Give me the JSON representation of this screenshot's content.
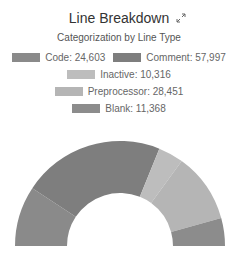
{
  "header": {
    "title": "Line Breakdown",
    "subtitle": "Categorization by Line Type",
    "expand_icon": "expand-icon"
  },
  "legend": [
    {
      "label": "Code: 24,603",
      "color": "#8a8a8a"
    },
    {
      "label": "Comment: 57,997",
      "color": "#7e7e7e"
    },
    {
      "label": "Inactive: 10,316",
      "color": "#bdbdbd"
    },
    {
      "label": "Preprocessor: 28,451",
      "color": "#b5b5b5"
    },
    {
      "label": "Blank: 11,368",
      "color": "#8c8c8c"
    }
  ],
  "chart_data": {
    "type": "pie",
    "subtype": "semi-donut",
    "title": "Line Breakdown",
    "subtitle": "Categorization by Line Type",
    "categories": [
      "Code",
      "Comment",
      "Inactive",
      "Preprocessor",
      "Blank"
    ],
    "values": [
      24603,
      57997,
      10316,
      28451,
      11368
    ],
    "colors": [
      "#8a8a8a",
      "#7e7e7e",
      "#bdbdbd",
      "#b5b5b5",
      "#8c8c8c"
    ],
    "legend_position": "top"
  }
}
